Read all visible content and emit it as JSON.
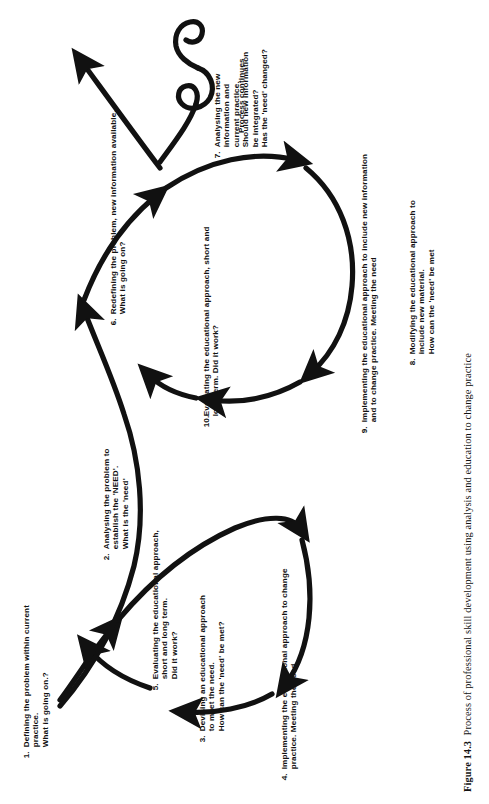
{
  "figure": {
    "caption_label": "Figure 14.3",
    "caption_text": "Process of professional skill development using analysis and education to change practice",
    "process_continues_label": "Process continues"
  },
  "steps": [
    {
      "number": "1.",
      "text": "Defining the problem within current\npractice.\nWhat is going on.?"
    },
    {
      "number": "2.",
      "text": "Analysing the problem to\nestablish the 'NEED'.\nWhat is the 'need'"
    },
    {
      "number": "3.",
      "text": "Devising an educational approach\nto meet the need.\nHow can the 'need' be met?"
    },
    {
      "number": "4.",
      "text": "Implementing the educational approach to change\npractice. Meeting the need"
    },
    {
      "number": "5.",
      "text": "Evaluating the educational approach,\nshort and long term.\nDid it work?"
    },
    {
      "number": "6.",
      "text": "Redefining the problem, new information available.\nWhat is going on?"
    },
    {
      "number": "7.",
      "text": "Analysing the new\ninformation and\ncurrent practice.\nShould new information\nbe integrated?\nHas the 'need' changed?"
    },
    {
      "number": "8.",
      "text": "Modifying the educational approach to\ninclude new material.\nHow can the 'need' be met"
    },
    {
      "number": "9.",
      "text": "Implementing the educational approach to include new information\nand to change practice. Meeting the need"
    },
    {
      "number": "10.",
      "text": "Evaluating the educational approach, short and\nlong term. Did it work?"
    }
  ],
  "colors": {
    "ink": "#111111",
    "background": "#ffffff"
  }
}
